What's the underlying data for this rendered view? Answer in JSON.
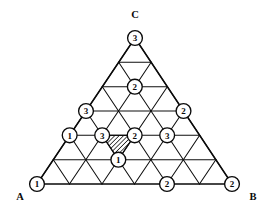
{
  "figure": {
    "type": "diagram",
    "background_color": "#ffffff",
    "line_color": "#0a0a0a",
    "subdivisions_per_side": 6,
    "vertex_rows": 7,
    "corner_labels": [
      {
        "name": "corner-label-c",
        "text": "C",
        "x": 135,
        "y": 14
      },
      {
        "name": "corner-label-a",
        "text": "A",
        "x": 20,
        "y": 196
      },
      {
        "name": "corner-label-b",
        "text": "B",
        "x": 253,
        "y": 196
      }
    ],
    "geometry": {
      "apex_x": 135,
      "apex_y": 38,
      "base_left_x": 37,
      "base_right_x": 232,
      "base_y": 184,
      "circle_radius": 7.4
    },
    "labelled_vertices": [
      {
        "name": "vertex-apex",
        "row": 0,
        "col": 0,
        "value": "3"
      },
      {
        "name": "vertex-r2-c1",
        "row": 2,
        "col": 1,
        "value": "2"
      },
      {
        "name": "vertex-r3-c0",
        "row": 3,
        "col": 0,
        "value": "3"
      },
      {
        "name": "vertex-r3-c3",
        "row": 3,
        "col": 3,
        "value": "2"
      },
      {
        "name": "vertex-r4-c0",
        "row": 4,
        "col": 0,
        "value": "1"
      },
      {
        "name": "vertex-r4-c1",
        "row": 4,
        "col": 1,
        "value": "3"
      },
      {
        "name": "vertex-r4-c2",
        "row": 4,
        "col": 2,
        "value": "2"
      },
      {
        "name": "vertex-r4-c3",
        "row": 4,
        "col": 3,
        "value": "3"
      },
      {
        "name": "vertex-r5-c2",
        "row": 5,
        "col": 2,
        "value": "1"
      },
      {
        "name": "vertex-r6-c0",
        "row": 6,
        "col": 0,
        "value": "1"
      },
      {
        "name": "vertex-r6-c4",
        "row": 6,
        "col": 4,
        "value": "2"
      },
      {
        "name": "vertex-r6-c6",
        "row": 6,
        "col": 6,
        "value": "2"
      }
    ],
    "hatched_cell": {
      "name": "hatched-triangle",
      "orientation": "down",
      "row": 4,
      "col": 1,
      "description": "shaded downward triangle bounded by vertices labelled 3, 2 and 1",
      "fill_pattern": "diagonal-hatch",
      "hatch_color": "#1a1a1a"
    }
  }
}
